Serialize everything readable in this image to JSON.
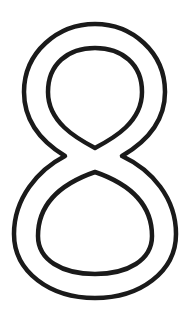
{
  "glyph": {
    "character": "8",
    "style": "outline",
    "stroke_color": "#1a1a1a",
    "background_color": "#ffffff"
  }
}
